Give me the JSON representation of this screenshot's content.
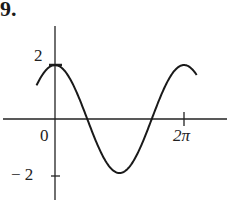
{
  "problem_number": "9.",
  "labels": {
    "y_max": "2",
    "y_min": "− 2",
    "x_origin": "0",
    "x_two_pi": "2π"
  },
  "chart_data": {
    "type": "line",
    "title": "",
    "function": "y = 2cos(x)",
    "xlabel": "",
    "ylabel": "",
    "x_ticks": [
      {
        "value": 0,
        "label": "0"
      },
      {
        "value": 6.2832,
        "label": "2π"
      }
    ],
    "y_ticks": [
      {
        "value": 2,
        "label": "2"
      },
      {
        "value": -2,
        "label": "-2"
      }
    ],
    "xlim": [
      -1.0,
      7.0
    ],
    "ylim": [
      -2.5,
      3.0
    ],
    "grid": false,
    "series": [
      {
        "name": "2cos(x)",
        "x": [
          -0.9,
          0,
          1.5708,
          3.1416,
          4.7124,
          6.2832,
          7.0
        ],
        "y": [
          1.24,
          2,
          0,
          -2,
          0,
          2,
          1.51
        ]
      }
    ]
  }
}
